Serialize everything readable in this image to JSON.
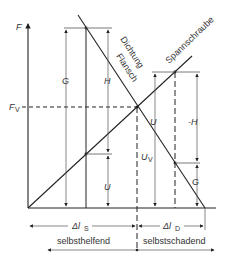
{
  "diagram": {
    "type": "force-elongation diagram (bolted joint)",
    "axis": {
      "y_label": "F"
    },
    "preload_label": {
      "main": "F",
      "sub": "V"
    },
    "lines": {
      "bolt": "Spannschraube",
      "gasket_line1": "Dichtung",
      "gasket_line2": "Flansch"
    },
    "left_arrows": {
      "g": "G",
      "h": "H",
      "u": "U"
    },
    "center_arrow": {
      "main": "U",
      "sub": "V"
    },
    "right_arrows": {
      "u": "U",
      "minus_h": "-H",
      "g": "G"
    },
    "bottom": {
      "dl_s": {
        "main": "Δl",
        "sub": "S"
      },
      "dl_d": {
        "main": "Δl",
        "sub": "D"
      },
      "left_region": "selbsthelfend",
      "right_region": "selbstschadend"
    },
    "colors": {
      "line": "#222222",
      "thin": "#555555",
      "text": "#333333"
    }
  }
}
